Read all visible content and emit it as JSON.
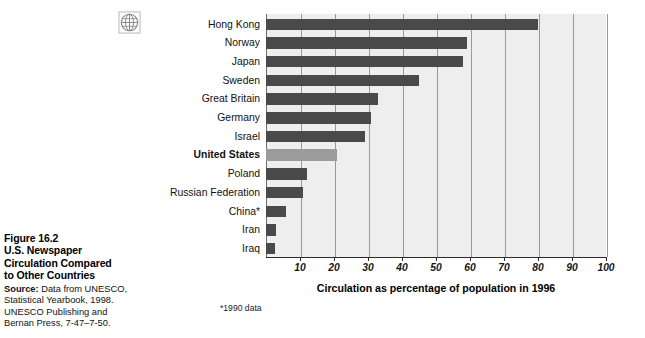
{
  "figure": {
    "number": "Figure 16.2",
    "title_line1": "U.S. Newspaper",
    "title_line2": "Circulation Compared",
    "title_line3": "to Other Countries",
    "source_lead": "Source:",
    "source_line1": " Data from UNESCO,",
    "source_line2": "Statistical Yearbook, 1998.",
    "source_line3": "UNESCO Publishing and",
    "source_line4": "Bernan Press, 7-47–7-50."
  },
  "icons": {
    "globe": "globe-icon"
  },
  "footnote": "*1990 data",
  "colors": {
    "bar": "#4a4a4a",
    "bar_highlight": "#9b9b9b",
    "plot_background": "#eeeeee",
    "gridline": "#9a9a9a",
    "axis": "#2b2b2b"
  },
  "chart_data": {
    "type": "bar",
    "orientation": "horizontal",
    "title": "U.S. Newspaper Circulation Compared to Other Countries",
    "xlabel": "Circulation as percentage of population in 1996",
    "ylabel": "",
    "xlim": [
      0,
      100
    ],
    "xticks": [
      10,
      20,
      30,
      40,
      50,
      60,
      70,
      80,
      90,
      100
    ],
    "xtick_labels": [
      "10",
      "20",
      "30",
      "40",
      "50",
      "60",
      "70",
      "80",
      "90",
      "100"
    ],
    "grid": true,
    "legend": false,
    "highlight_category": "United States",
    "categories": [
      "Hong Kong",
      "Norway",
      "Japan",
      "Sweden",
      "Great Britain",
      "Germany",
      "Israel",
      "United States",
      "Poland",
      "Russian Federation",
      "China*",
      "Iran",
      "Iraq"
    ],
    "values": [
      80,
      59,
      58,
      45,
      33,
      31,
      29,
      21,
      12,
      11,
      6,
      3,
      2.5
    ],
    "annotations": [
      "*1990 data"
    ]
  }
}
